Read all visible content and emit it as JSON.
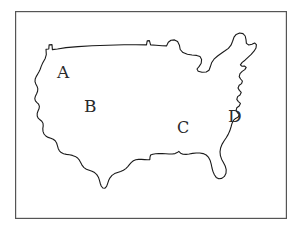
{
  "figure": {
    "background_color": "#ffffff",
    "ink_color": "#1a1a1a",
    "frame": {
      "name": "border-frame",
      "stroke_color": "#555555",
      "stroke_width": 1.2,
      "x": 15,
      "y": 11,
      "width": 272,
      "height": 208
    },
    "map": {
      "name": "usa-outline",
      "stroke_color": "#1a1a1a",
      "stroke_width": 1.1,
      "fill": "none"
    }
  },
  "labels": [
    {
      "id": "label-a",
      "text": "A",
      "region_hint": "Pacific Northwest / Northwest",
      "x": 57,
      "y": 64
    },
    {
      "id": "label-b",
      "text": "B",
      "region_hint": "Southwest / Interior West",
      "x": 84,
      "y": 98
    },
    {
      "id": "label-c",
      "text": "C",
      "region_hint": "South Central / Gulf interior",
      "x": 177,
      "y": 120
    },
    {
      "id": "label-d",
      "text": "D",
      "region_hint": "Southeast / Atlantic Coast",
      "x": 228,
      "y": 108
    }
  ]
}
